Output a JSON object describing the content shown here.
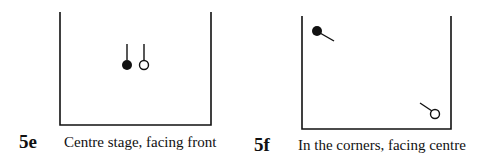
{
  "figures": [
    {
      "id": "5e",
      "label": "5e",
      "caption": "Centre stage, facing front",
      "stage_box": {
        "left": 60,
        "top": 12,
        "right": 211,
        "bottom": 125
      },
      "performers": [
        {
          "type": "filled",
          "cx": 127,
          "cy": 65,
          "r": 5,
          "facing_line": {
            "x1": 127,
            "y1": 60,
            "x2": 127,
            "y2": 44
          }
        },
        {
          "type": "hollow",
          "cx": 144,
          "cy": 65,
          "r": 5,
          "facing_line": {
            "x1": 144,
            "y1": 60,
            "x2": 144,
            "y2": 44
          }
        }
      ]
    },
    {
      "id": "5f",
      "label": "5f",
      "caption": "In the corners, facing centre",
      "stage_box": {
        "left": 302,
        "top": 16,
        "right": 451,
        "bottom": 129
      },
      "performers": [
        {
          "type": "filled",
          "cx": 317,
          "cy": 31,
          "r": 5,
          "facing_line": {
            "x1": 320,
            "y1": 33,
            "x2": 334,
            "y2": 41
          }
        },
        {
          "type": "hollow",
          "cx": 435,
          "cy": 114,
          "r": 4.5,
          "facing_line": {
            "x1": 420,
            "y1": 103,
            "x2": 432,
            "y2": 111
          }
        }
      ]
    }
  ],
  "colors": {
    "ink": "#111111",
    "paper": "#ffffff"
  }
}
